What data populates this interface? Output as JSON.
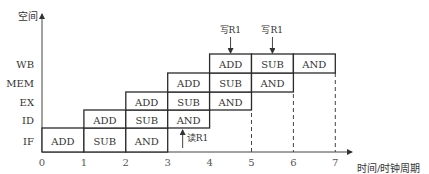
{
  "diagram": {
    "y_axis_label": "空间",
    "x_axis_label": "时间/时钟周期",
    "stages": [
      "IF",
      "ID",
      "EX",
      "MEM",
      "WB"
    ],
    "ticks": [
      "0",
      "1",
      "2",
      "3",
      "4",
      "5",
      "6",
      "7"
    ],
    "instructions": [
      "ADD",
      "SUB",
      "AND"
    ],
    "cells": [
      {
        "stage": 0,
        "start": 0,
        "label": "ADD"
      },
      {
        "stage": 0,
        "start": 1,
        "label": "SUB"
      },
      {
        "stage": 0,
        "start": 2,
        "label": "AND"
      },
      {
        "stage": 1,
        "start": 1,
        "label": "ADD"
      },
      {
        "stage": 1,
        "start": 2,
        "label": "SUB"
      },
      {
        "stage": 1,
        "start": 3,
        "label": "AND"
      },
      {
        "stage": 2,
        "start": 2,
        "label": "ADD"
      },
      {
        "stage": 2,
        "start": 3,
        "label": "SUB"
      },
      {
        "stage": 2,
        "start": 4,
        "label": "AND"
      },
      {
        "stage": 3,
        "start": 3,
        "label": "ADD"
      },
      {
        "stage": 3,
        "start": 4,
        "label": "SUB"
      },
      {
        "stage": 3,
        "start": 5,
        "label": "AND"
      },
      {
        "stage": 4,
        "start": 4,
        "label": "ADD"
      },
      {
        "stage": 4,
        "start": 5,
        "label": "SUB"
      },
      {
        "stage": 4,
        "start": 6,
        "label": "AND"
      }
    ],
    "dashed_lines_at": [
      5,
      6,
      7
    ],
    "annotations": [
      {
        "text": "写R1",
        "at": 4.5,
        "direction": "down",
        "target": "WB top"
      },
      {
        "text": "写R1",
        "at": 5.5,
        "direction": "down",
        "target": "WB top"
      },
      {
        "text": "读R1",
        "at": 3.5,
        "direction": "up",
        "target": "ID bottom"
      }
    ]
  }
}
